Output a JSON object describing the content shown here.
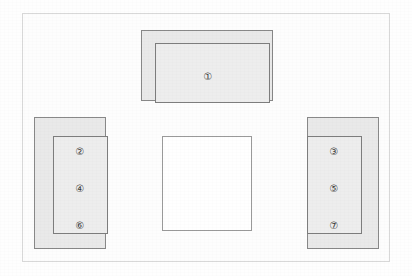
{
  "diagram": {
    "page_frame": {
      "border_color": "#d8d8d8",
      "background": "#fdfdfd"
    },
    "palette": {
      "block_fill": "#e9e9e9",
      "inner_fill": "#ededed",
      "block_stroke": "#888888",
      "inner_stroke": "#7d7d7d",
      "open_fill": "#ffffff",
      "open_stroke": "#9a9a9a",
      "label_color": "#3a3a3a"
    },
    "blocks": [
      {
        "id": "top",
        "name": "top-block",
        "orientation": "horizontal",
        "inner_offset": "inset-centered-bottom-open",
        "labels": [
          "①"
        ]
      },
      {
        "id": "left",
        "name": "left-block",
        "orientation": "vertical",
        "inner_offset": "right",
        "labels": [
          "②",
          "④",
          "⑥"
        ]
      },
      {
        "id": "right",
        "name": "right-block",
        "orientation": "vertical",
        "inner_offset": "left",
        "labels": [
          "③",
          "⑤",
          "⑦"
        ]
      }
    ],
    "center": {
      "name": "center-open-area",
      "label": ""
    },
    "labels": {
      "one": "①",
      "two": "②",
      "three": "③",
      "four": "④",
      "five": "⑤",
      "six": "⑥",
      "seven": "⑦"
    }
  }
}
